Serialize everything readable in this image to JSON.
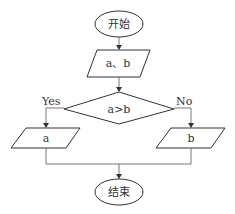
{
  "flowchart": {
    "start": {
      "label": "开始",
      "shape": "ellipse"
    },
    "input": {
      "label": "a、b",
      "shape": "parallelogram"
    },
    "decision": {
      "label": "a>b",
      "shape": "diamond"
    },
    "yes_branch": {
      "edge_label": "Yes",
      "output": {
        "label": "a",
        "shape": "parallelogram"
      }
    },
    "no_branch": {
      "edge_label": "No",
      "output": {
        "label": "b",
        "shape": "parallelogram"
      }
    },
    "end": {
      "label": "结束",
      "shape": "ellipse"
    }
  },
  "colors": {
    "stroke": "#333333",
    "background": "#ffffff"
  }
}
